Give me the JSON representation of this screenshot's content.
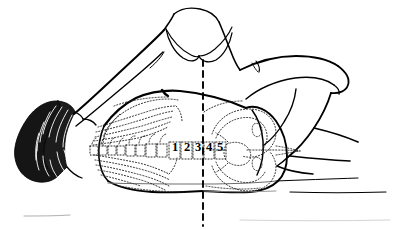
{
  "figure": {
    "kind": "anatomical-line-drawing",
    "medium": "black ink line art on white background",
    "colors": {
      "ink": "#000000",
      "background": "#ffffff",
      "dotted_overlay": "#2b2b2b",
      "faint_trace": "#b5b5b5"
    },
    "canvas": {
      "width": 398,
      "height": 230
    },
    "reference_line": {
      "name": "midline-reference",
      "style": "dashed vertical",
      "x": 203,
      "y_top": 60,
      "y_bottom": 226,
      "dash": "6,5",
      "width": 1.9
    },
    "vertebra_labels": [
      {
        "text": "1",
        "x": 175,
        "y": 151
      },
      {
        "text": "2",
        "x": 187,
        "y": 151
      },
      {
        "text": "3",
        "x": 198,
        "y": 151
      },
      {
        "text": "4",
        "x": 209,
        "y": 151
      },
      {
        "text": "5",
        "x": 220,
        "y": 151
      }
    ],
    "parts": [
      {
        "name": "head-with-dark-hair",
        "description": "shaded hatched hair mass at far left"
      },
      {
        "name": "neck-and-shoulder",
        "description": "upper left arm sweeping up to shoulder"
      },
      {
        "name": "scapula-pair",
        "description": "two curved scapula outlines below the neck"
      },
      {
        "name": "torso-back",
        "description": "large back outline spanning the center"
      },
      {
        "name": "ribcage-overlay",
        "description": "dotted ribs radiating from thoracic spine"
      },
      {
        "name": "thoracolumbar-spine-overlay",
        "description": "dotted vertebral column along midline"
      },
      {
        "name": "pelvis-overlay",
        "description": "dotted pelvis and sacrum right of the midline"
      },
      {
        "name": "buttock-hip",
        "description": "rounded hip and buttock contour right of center"
      },
      {
        "name": "upper-arm-right",
        "description": "arm bent at the elbow over the torso"
      },
      {
        "name": "forearm-right",
        "description": "forearm descending to the table"
      },
      {
        "name": "thigh",
        "description": "flexed thigh at the right edge"
      },
      {
        "name": "table-surface-lines",
        "description": "thin horizontal support lines"
      }
    ]
  }
}
